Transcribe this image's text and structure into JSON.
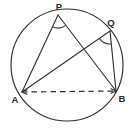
{
  "figure": {
    "background_color": "#ffffff",
    "stroke_color": "#2f2f2f",
    "label_color": "#2b2b2b",
    "width": 133,
    "height": 132
  },
  "circle": {
    "name": "circumscribed-circle",
    "center_x": 67,
    "center_y": 65,
    "radius": 56,
    "stroke": "#2f2f2f",
    "stroke_width": 1.15,
    "fill": "none"
  },
  "points": [
    {
      "id": "P",
      "label": "P",
      "x": 58,
      "y": 15,
      "label_x": 59,
      "label_y": 7,
      "label_anchor": "middle"
    },
    {
      "id": "Q",
      "label": "Q",
      "x": 110,
      "y": 31,
      "label_x": 111,
      "label_y": 23,
      "label_anchor": "middle"
    },
    {
      "id": "A",
      "label": "A",
      "x": 22,
      "y": 92,
      "label_x": 15,
      "label_y": 100,
      "label_anchor": "middle"
    },
    {
      "id": "B",
      "label": "B",
      "x": 116,
      "y": 91,
      "label_x": 122,
      "label_y": 99,
      "label_anchor": "middle"
    }
  ],
  "segments": [
    {
      "id": "PA",
      "from": "P",
      "to": "A",
      "style": "solid",
      "arrows": "none"
    },
    {
      "id": "PB",
      "from": "P",
      "to": "B",
      "style": "solid",
      "arrows": "none"
    },
    {
      "id": "QA",
      "from": "Q",
      "to": "A",
      "style": "solid",
      "arrows": "none"
    },
    {
      "id": "QB",
      "from": "Q",
      "to": "B",
      "style": "solid",
      "arrows": "none"
    },
    {
      "id": "AB",
      "from": "A",
      "to": "B",
      "style": "dashed",
      "arrows": "both"
    }
  ],
  "angle_marks": [
    {
      "id": "angle-at-P",
      "vertex": "P",
      "arc_radius": 13,
      "rays": [
        "A",
        "B"
      ]
    },
    {
      "id": "angle-at-Q",
      "vertex": "Q",
      "arc_radius": 13,
      "rays": [
        "A",
        "B"
      ]
    }
  ],
  "notes": {
    "dash_pattern": "5.5 4",
    "arrow_size": 5.5
  }
}
